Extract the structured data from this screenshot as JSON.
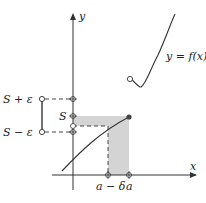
{
  "diagram": {
    "axes": {
      "x_label": "x",
      "y_label": "y"
    },
    "function_label": "y = f(x)",
    "y_ticks": {
      "s_plus_eps": "S + ε",
      "s": "S",
      "s_minus_eps": "S − ε"
    },
    "x_ticks": {
      "a_minus_delta": "a − δ",
      "a": "a"
    },
    "colors": {
      "shade": "#d4d4d4",
      "line": "#333333",
      "dot": "#444444"
    }
  }
}
